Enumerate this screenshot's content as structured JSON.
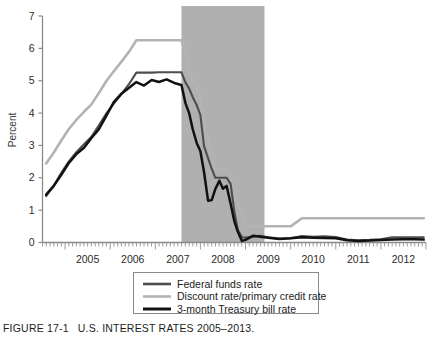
{
  "caption": {
    "figure_number": "FIGURE 17-1",
    "title": "U.S. INTEREST RATES 2005–2013."
  },
  "axes": {
    "ylabel": "Percent",
    "yticks": [
      "0",
      "1",
      "2",
      "3",
      "4",
      "5",
      "6",
      "7"
    ],
    "xticks": [
      "2005",
      "2006",
      "2007",
      "2008",
      "2009",
      "2010",
      "2011",
      "2012"
    ]
  },
  "legend": {
    "items": [
      {
        "label": "Federal funds rate",
        "color": "#4d4d4d"
      },
      {
        "label": "Discount rate/primary credit rate",
        "color": "#b3b3b3"
      },
      {
        "label": "3-month Treasury bill rate",
        "color": "#111111"
      }
    ]
  },
  "colors": {
    "federal_funds": "#4d4d4d",
    "discount_rate": "#b3b3b3",
    "treasury_bill": "#111111",
    "recession_band": "#b0b0b0",
    "axis": "#8a8a8a"
  },
  "chart_data": {
    "type": "line",
    "title": "U.S. INTEREST RATES 2005–2013.",
    "xlabel": "",
    "ylabel": "Percent",
    "xlim": [
      2004.5,
      2013.0
    ],
    "ylim": [
      0,
      7
    ],
    "grid": false,
    "legend_position": "bottom-center",
    "annotations": [
      {
        "type": "recession-band",
        "label": "Recession shading",
        "x_start": 2007.58,
        "x_end": 2009.42,
        "color": "#b0b0b0"
      }
    ],
    "x": [
      2004.58,
      2004.75,
      2004.92,
      2005.08,
      2005.25,
      2005.42,
      2005.58,
      2005.75,
      2005.92,
      2006.08,
      2006.25,
      2006.42,
      2006.58,
      2006.75,
      2006.92,
      2007.08,
      2007.25,
      2007.42,
      2007.58,
      2007.67,
      2007.75,
      2007.83,
      2007.92,
      2008.0,
      2008.08,
      2008.17,
      2008.25,
      2008.33,
      2008.42,
      2008.5,
      2008.58,
      2008.67,
      2008.75,
      2008.83,
      2008.92,
      2009.0,
      2009.17,
      2009.33,
      2009.5,
      2009.75,
      2010.0,
      2010.25,
      2010.5,
      2010.75,
      2011.0,
      2011.25,
      2011.5,
      2011.75,
      2012.0,
      2012.25,
      2012.5,
      2012.75,
      2012.95
    ],
    "series": [
      {
        "name": "Federal funds rate",
        "color": "#4d4d4d",
        "values": [
          1.43,
          1.76,
          2.16,
          2.5,
          2.79,
          3.04,
          3.26,
          3.62,
          4.0,
          4.29,
          4.59,
          4.9,
          5.25,
          5.25,
          5.25,
          5.26,
          5.26,
          5.26,
          5.26,
          4.94,
          4.76,
          4.49,
          4.24,
          3.94,
          2.98,
          2.61,
          2.28,
          2.0,
          2.0,
          2.0,
          2.0,
          1.81,
          0.97,
          0.39,
          0.16,
          0.15,
          0.18,
          0.21,
          0.16,
          0.12,
          0.13,
          0.2,
          0.18,
          0.19,
          0.17,
          0.09,
          0.07,
          0.08,
          0.1,
          0.16,
          0.16,
          0.16,
          0.16
        ]
      },
      {
        "name": "Discount rate/primary credit rate",
        "color": "#b3b3b3",
        "values": [
          2.44,
          2.78,
          3.16,
          3.5,
          3.79,
          4.04,
          4.26,
          4.62,
          5.0,
          5.29,
          5.59,
          5.9,
          6.25,
          6.25,
          6.25,
          6.25,
          6.25,
          6.25,
          6.25,
          5.87,
          5.25,
          5.0,
          4.83,
          4.5,
          3.5,
          3.25,
          2.5,
          2.25,
          2.25,
          2.25,
          2.25,
          2.1,
          1.5,
          1.25,
          0.86,
          0.5,
          0.5,
          0.5,
          0.5,
          0.5,
          0.5,
          0.75,
          0.75,
          0.75,
          0.75,
          0.75,
          0.75,
          0.75,
          0.75,
          0.75,
          0.75,
          0.75,
          0.75
        ]
      },
      {
        "name": "3-month Treasury bill rate",
        "color": "#111111",
        "values": [
          1.48,
          1.75,
          2.1,
          2.45,
          2.73,
          2.93,
          3.22,
          3.5,
          3.93,
          4.34,
          4.6,
          4.78,
          4.96,
          4.85,
          5.02,
          4.96,
          5.04,
          4.93,
          4.87,
          4.3,
          4.0,
          3.5,
          3.07,
          2.82,
          2.18,
          1.29,
          1.31,
          1.65,
          1.91,
          1.66,
          1.75,
          1.2,
          0.67,
          0.33,
          0.05,
          0.08,
          0.21,
          0.18,
          0.15,
          0.11,
          0.13,
          0.16,
          0.15,
          0.14,
          0.13,
          0.07,
          0.05,
          0.06,
          0.08,
          0.09,
          0.1,
          0.1,
          0.09
        ]
      }
    ]
  }
}
